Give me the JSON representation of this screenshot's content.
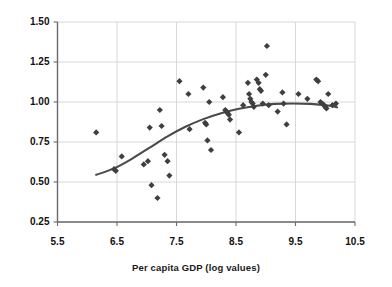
{
  "chart_data": {
    "type": "scatter",
    "title": "",
    "xlabel": "Per capita GDP (log values)",
    "ylabel": "",
    "xlim": [
      5.5,
      10.5
    ],
    "ylim": [
      0.25,
      1.5
    ],
    "xticks": [
      "5.5",
      "6.5",
      "7.5",
      "8.5",
      "9.5",
      "10.5"
    ],
    "xtick_values": [
      5.5,
      6.5,
      7.5,
      8.5,
      9.5,
      10.5
    ],
    "yticks": [
      "0.25",
      "0.50",
      "0.75",
      "1.00",
      "1.25",
      "1.50"
    ],
    "ytick_values": [
      0.25,
      0.5,
      0.75,
      1.0,
      1.25,
      1.5
    ],
    "grid": "both",
    "legend": "none",
    "marker": "diamond",
    "marker_color": "#3f3f3f",
    "line_color": "#4a4a4a",
    "axis_color": "#6b6b6b",
    "grid_color": "#d4d4d4",
    "series": [
      {
        "name": "observations",
        "type": "scatter",
        "points": [
          [
            6.15,
            0.81
          ],
          [
            6.45,
            0.58
          ],
          [
            6.48,
            0.57
          ],
          [
            6.58,
            0.66
          ],
          [
            6.95,
            0.61
          ],
          [
            7.02,
            0.63
          ],
          [
            7.05,
            0.84
          ],
          [
            7.08,
            0.48
          ],
          [
            7.18,
            0.4
          ],
          [
            7.22,
            0.95
          ],
          [
            7.25,
            0.85
          ],
          [
            7.3,
            0.67
          ],
          [
            7.35,
            0.63
          ],
          [
            7.38,
            0.54
          ],
          [
            7.55,
            1.13
          ],
          [
            7.7,
            1.05
          ],
          [
            7.72,
            0.83
          ],
          [
            7.95,
            1.09
          ],
          [
            7.98,
            0.87
          ],
          [
            8.0,
            0.86
          ],
          [
            8.02,
            0.76
          ],
          [
            8.05,
            1.0
          ],
          [
            8.08,
            0.7
          ],
          [
            8.28,
            1.03
          ],
          [
            8.32,
            0.95
          ],
          [
            8.34,
            0.94
          ],
          [
            8.36,
            0.93
          ],
          [
            8.38,
            0.92
          ],
          [
            8.4,
            0.89
          ],
          [
            8.55,
            0.81
          ],
          [
            8.62,
            0.98
          ],
          [
            8.7,
            1.12
          ],
          [
            8.72,
            1.05
          ],
          [
            8.74,
            1.02
          ],
          [
            8.76,
            1.0
          ],
          [
            8.78,
            0.99
          ],
          [
            8.8,
            0.97
          ],
          [
            8.85,
            1.14
          ],
          [
            8.88,
            1.12
          ],
          [
            8.9,
            1.08
          ],
          [
            8.92,
            1.07
          ],
          [
            8.95,
            0.99
          ],
          [
            9.0,
            1.17
          ],
          [
            9.02,
            1.35
          ],
          [
            9.05,
            0.98
          ],
          [
            9.2,
            0.94
          ],
          [
            9.28,
            1.06
          ],
          [
            9.3,
            0.99
          ],
          [
            9.35,
            0.86
          ],
          [
            9.55,
            1.05
          ],
          [
            9.7,
            1.02
          ],
          [
            9.85,
            1.14
          ],
          [
            9.88,
            1.13
          ],
          [
            9.92,
            1.0
          ],
          [
            9.95,
            0.99
          ],
          [
            9.98,
            0.98
          ],
          [
            10.0,
            0.97
          ],
          [
            10.02,
            0.96
          ],
          [
            10.05,
            1.05
          ],
          [
            10.12,
            0.98
          ],
          [
            10.18,
            0.99
          ]
        ]
      },
      {
        "name": "fitted-trend",
        "type": "line",
        "points": [
          [
            6.15,
            0.545
          ],
          [
            6.45,
            0.585
          ],
          [
            6.75,
            0.645
          ],
          [
            7.05,
            0.715
          ],
          [
            7.35,
            0.785
          ],
          [
            7.65,
            0.845
          ],
          [
            7.95,
            0.893
          ],
          [
            8.25,
            0.93
          ],
          [
            8.55,
            0.958
          ],
          [
            8.85,
            0.977
          ],
          [
            9.15,
            0.988
          ],
          [
            9.45,
            0.991
          ],
          [
            9.75,
            0.988
          ],
          [
            10.05,
            0.978
          ],
          [
            10.2,
            0.967
          ]
        ]
      }
    ]
  },
  "axis": {
    "x_title": "Per capita GDP (log values)"
  }
}
